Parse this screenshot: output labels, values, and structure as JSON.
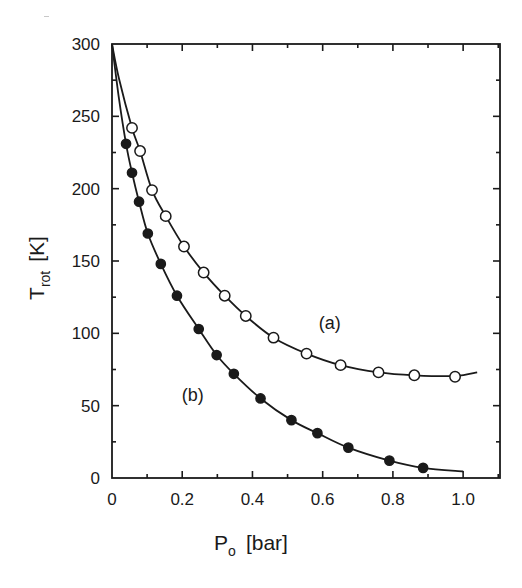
{
  "chart_data": {
    "type": "line",
    "title": "",
    "xlabel": "P",
    "xlabel_sub": "o",
    "xlabel_unit": "[bar]",
    "ylabel": "T",
    "ylabel_sub": "rot",
    "ylabel_unit": "[K]",
    "xlim": [
      0,
      1.105
    ],
    "ylim": [
      0,
      300
    ],
    "x_ticks": [
      0,
      0.2,
      0.4,
      0.6,
      0.8,
      1.0
    ],
    "x_tick_labels": [
      "0",
      "0.2",
      "0.4",
      "0.6",
      "0.8",
      "1.0"
    ],
    "x_minor_step": 0.1,
    "y_ticks": [
      0,
      50,
      100,
      150,
      200,
      250,
      300
    ],
    "y_tick_labels": [
      "0",
      "50",
      "100",
      "150",
      "200",
      "250",
      "300"
    ],
    "y_minor_step": 25,
    "grid": false,
    "legend": "none (inline series labels)",
    "annotations": [
      {
        "text": "(a)",
        "x": 0.62,
        "y": 103
      },
      {
        "text": "(b)",
        "x": 0.23,
        "y": 53
      }
    ],
    "series": [
      {
        "name": "(a)",
        "marker": "open-circle",
        "points": [
          [
            0.057,
            242
          ],
          [
            0.08,
            226
          ],
          [
            0.114,
            199
          ],
          [
            0.153,
            181
          ],
          [
            0.205,
            160
          ],
          [
            0.261,
            142
          ],
          [
            0.321,
            126
          ],
          [
            0.381,
            112
          ],
          [
            0.46,
            97
          ],
          [
            0.554,
            86
          ],
          [
            0.651,
            78
          ],
          [
            0.759,
            73
          ],
          [
            0.861,
            71
          ],
          [
            0.977,
            70
          ]
        ],
        "curve": [
          [
            0.0,
            300
          ],
          [
            0.02,
            276
          ],
          [
            0.057,
            242
          ],
          [
            0.08,
            226
          ],
          [
            0.114,
            199
          ],
          [
            0.153,
            181
          ],
          [
            0.205,
            160
          ],
          [
            0.261,
            142
          ],
          [
            0.321,
            126
          ],
          [
            0.381,
            112
          ],
          [
            0.46,
            97
          ],
          [
            0.554,
            86
          ],
          [
            0.651,
            78
          ],
          [
            0.759,
            73
          ],
          [
            0.861,
            71
          ],
          [
            0.977,
            70.5
          ],
          [
            1.04,
            73
          ]
        ]
      },
      {
        "name": "(b)",
        "marker": "filled-circle",
        "points": [
          [
            0.04,
            231
          ],
          [
            0.057,
            211
          ],
          [
            0.077,
            191
          ],
          [
            0.102,
            169
          ],
          [
            0.139,
            148
          ],
          [
            0.185,
            126
          ],
          [
            0.247,
            103
          ],
          [
            0.298,
            85
          ],
          [
            0.347,
            72
          ],
          [
            0.423,
            55
          ],
          [
            0.511,
            40
          ],
          [
            0.585,
            31
          ],
          [
            0.673,
            21
          ],
          [
            0.79,
            12
          ],
          [
            0.886,
            7
          ]
        ],
        "curve": [
          [
            0.0,
            300
          ],
          [
            0.02,
            262
          ],
          [
            0.04,
            231
          ],
          [
            0.057,
            211
          ],
          [
            0.077,
            191
          ],
          [
            0.102,
            169
          ],
          [
            0.139,
            148
          ],
          [
            0.185,
            126
          ],
          [
            0.247,
            103
          ],
          [
            0.298,
            85
          ],
          [
            0.347,
            72
          ],
          [
            0.423,
            55
          ],
          [
            0.511,
            40
          ],
          [
            0.585,
            31
          ],
          [
            0.673,
            21
          ],
          [
            0.79,
            12
          ],
          [
            0.886,
            7
          ],
          [
            1.0,
            4.5
          ]
        ]
      }
    ]
  },
  "plot_area": {
    "left": 112,
    "top": 44,
    "right": 500,
    "bottom": 478
  },
  "colors": {
    "ink": "#1a1a1a",
    "background": "#ffffff"
  }
}
